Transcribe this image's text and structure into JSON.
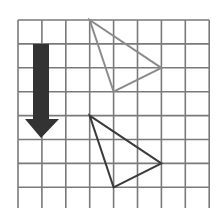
{
  "diagram": {
    "type": "grid-translation",
    "grid": {
      "origin_px": [
        18,
        20
      ],
      "cell_px": 23.9,
      "cols": 8,
      "rows": 8,
      "line_color": "#7a7a7a",
      "background": "#ffffff"
    },
    "arrow": {
      "direction": "down",
      "color": "#333333",
      "shaft": {
        "x1": 33,
        "x2": 49,
        "y1": 44,
        "y2": 120
      },
      "head": {
        "left": 25,
        "right": 59,
        "top": 119,
        "tip_x": 41,
        "tip_y": 138
      }
    },
    "shapes": [
      {
        "name": "original-triangle",
        "vertices_grid": [
          [
            3,
            0
          ],
          [
            6,
            2
          ],
          [
            4,
            3
          ]
        ],
        "stroke": "#8a8a8a"
      },
      {
        "name": "translated-triangle",
        "vertices_grid": [
          [
            3,
            4
          ],
          [
            6,
            6
          ],
          [
            4,
            7
          ]
        ],
        "stroke": "#3a3a3a"
      }
    ]
  }
}
